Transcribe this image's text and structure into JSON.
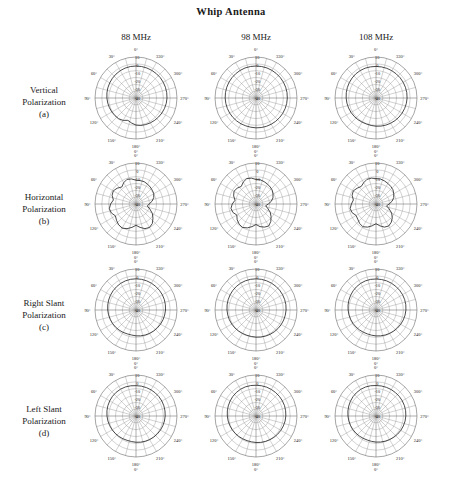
{
  "title": "Whip Antenna",
  "columns": [
    {
      "label": "88 MHz"
    },
    {
      "label": "98 MHz"
    },
    {
      "label": "108 MHz"
    }
  ],
  "rows": [
    {
      "name": "Vertical",
      "line2": "Polarization",
      "tag": "(a)"
    },
    {
      "name": "Horizontal",
      "line2": "Polarization",
      "tag": "(b)"
    },
    {
      "name": "Right Slant",
      "line2": "Polarization",
      "tag": "(c)"
    },
    {
      "name": "Left Slant",
      "line2": "Polarization",
      "tag": "(d)"
    }
  ],
  "chart_data": {
    "type": "line",
    "title": "Whip Antenna",
    "subtype": "polar radiation pattern grid",
    "grid_rows": 4,
    "grid_cols": 3,
    "angular_axis": {
      "unit": "degrees",
      "start_at_top": 0,
      "direction": "counterclockwise-labels",
      "tick_step": 30,
      "tick_labels": [
        "0°",
        "30°",
        "60°",
        "90°",
        "120°",
        "150°",
        "180°",
        "210°",
        "240°",
        "270°",
        "300°",
        "330°"
      ],
      "extra_bottom_label": "0°"
    },
    "radial_axis": {
      "unit": "dB",
      "tick_labels": [
        "10",
        "0",
        "-10",
        "-20",
        "-30",
        "-40"
      ],
      "outer_value": 10,
      "center_value": -40,
      "rings": 6
    },
    "panels": [
      {
        "row": "Vertical Polarization (a)",
        "frequency": "88 MHz",
        "shape": "near-omnidirectional, slight notch near 150-165 deg",
        "values_db": [
          -1,
          -1,
          -1.2,
          -1.5,
          -2,
          -2.5,
          -3,
          -3.5,
          -4,
          -4.5,
          -5,
          -5.5,
          -6,
          -6.5,
          -7,
          -8.5,
          -11,
          -9,
          -7,
          -6,
          -5.5,
          -5,
          -4.5,
          -4,
          -3.5,
          -3,
          -2.5,
          -2.2,
          -2,
          -1.8,
          -1.6,
          -1.4,
          -1.3,
          -1.2,
          -1.1,
          -1
        ]
      },
      {
        "row": "Vertical Polarization (a)",
        "frequency": "98 MHz",
        "shape": "near-omnidirectional, very smooth circle",
        "values_db": [
          -1,
          -1,
          -1,
          -1.2,
          -1.4,
          -1.6,
          -1.8,
          -2,
          -2.2,
          -2.4,
          -2.6,
          -2.8,
          -3,
          -3.2,
          -3.4,
          -3.6,
          -3.8,
          -3.8,
          -3.6,
          -3.4,
          -3.2,
          -3,
          -2.8,
          -2.6,
          -2.4,
          -2.2,
          -2,
          -1.8,
          -1.6,
          -1.5,
          -1.4,
          -1.3,
          -1.2,
          -1.1,
          -1,
          -1
        ]
      },
      {
        "row": "Vertical Polarization (a)",
        "frequency": "108 MHz",
        "shape": "near-omnidirectional, mild ripple",
        "values_db": [
          -1.5,
          -1.4,
          -1.3,
          -1.4,
          -1.6,
          -2,
          -2.4,
          -2.8,
          -3.2,
          -3.6,
          -4,
          -4.4,
          -4.8,
          -5.2,
          -5.6,
          -6,
          -6.2,
          -6,
          -5.6,
          -5.2,
          -4.8,
          -4.4,
          -4,
          -3.6,
          -3.2,
          -2.8,
          -2.4,
          -2.1,
          -1.9,
          -1.8,
          -1.7,
          -1.6,
          -1.6,
          -1.5,
          -1.5,
          -1.5
        ]
      },
      {
        "row": "Horizontal Polarization (b)",
        "frequency": "88 MHz",
        "shape": "strongly lobed, multiple deep nulls, figure-of-eight-like with ripples",
        "values_db": [
          -11,
          -9,
          -8,
          -10,
          -13,
          -10,
          -8,
          -9,
          -12,
          -9,
          -7,
          -8,
          -11,
          -9,
          -7,
          -6,
          -8,
          -11,
          -14,
          -11,
          -8,
          -7,
          -9,
          -13,
          -17,
          -22,
          -26,
          -24,
          -20,
          -17,
          -15,
          -14,
          -13,
          -12,
          -11,
          -11
        ]
      },
      {
        "row": "Horizontal Polarization (b)",
        "frequency": "98 MHz",
        "shape": "strongly lobed with nulls near 270-330 deg",
        "values_db": [
          -10,
          -8,
          -7,
          -9,
          -12,
          -10,
          -9,
          -11,
          -14,
          -11,
          -9,
          -10,
          -13,
          -10,
          -8,
          -7,
          -9,
          -12,
          -15,
          -12,
          -10,
          -9,
          -12,
          -16,
          -20,
          -25,
          -28,
          -25,
          -21,
          -18,
          -16,
          -14,
          -13,
          -12,
          -11,
          -10
        ]
      },
      {
        "row": "Horizontal Polarization (b)",
        "frequency": "108 MHz",
        "shape": "strongly lobed, two broad lobes upper-left and lower-right",
        "values_db": [
          -9,
          -8,
          -8,
          -10,
          -12,
          -10,
          -8,
          -9,
          -12,
          -10,
          -8,
          -9,
          -12,
          -11,
          -9,
          -8,
          -10,
          -13,
          -16,
          -13,
          -10,
          -9,
          -11,
          -14,
          -18,
          -23,
          -27,
          -24,
          -20,
          -17,
          -15,
          -13,
          -12,
          -11,
          -10,
          -9
        ]
      },
      {
        "row": "Right Slant Polarization (c)",
        "frequency": "88 MHz",
        "shape": "smooth near-circular, slight flattening near 90-120 deg",
        "values_db": [
          -2,
          -2,
          -2.2,
          -2.5,
          -3,
          -3.5,
          -4,
          -4.5,
          -5,
          -5.5,
          -6,
          -6.5,
          -7,
          -7.5,
          -8,
          -8.5,
          -9,
          -9,
          -8.5,
          -8,
          -7.5,
          -7,
          -6.5,
          -6,
          -5.5,
          -5,
          -4.5,
          -4,
          -3.6,
          -3.2,
          -2.9,
          -2.7,
          -2.5,
          -2.3,
          -2.1,
          -2
        ]
      },
      {
        "row": "Right Slant Polarization (c)",
        "frequency": "98 MHz",
        "shape": "smooth near-circular",
        "values_db": [
          -2,
          -2,
          -2.1,
          -2.3,
          -2.6,
          -3,
          -3.4,
          -3.8,
          -4.2,
          -4.6,
          -5,
          -5.4,
          -5.8,
          -6.2,
          -6.6,
          -7,
          -7.2,
          -7.2,
          -6.9,
          -6.5,
          -6.1,
          -5.7,
          -5.3,
          -4.9,
          -4.5,
          -4.1,
          -3.7,
          -3.3,
          -3,
          -2.8,
          -2.6,
          -2.4,
          -2.3,
          -2.2,
          -2.1,
          -2
        ]
      },
      {
        "row": "Right Slant Polarization (c)",
        "frequency": "108 MHz",
        "shape": "smooth near-circular with small ripple",
        "values_db": [
          -2.2,
          -2.1,
          -2.2,
          -2.5,
          -3,
          -3.6,
          -4.2,
          -4.8,
          -5.4,
          -6,
          -6.5,
          -7,
          -7.5,
          -8,
          -8.4,
          -8.8,
          -9,
          -8.8,
          -8.4,
          -8,
          -7.5,
          -7,
          -6.4,
          -5.8,
          -5.2,
          -4.6,
          -4,
          -3.5,
          -3.1,
          -2.8,
          -2.6,
          -2.5,
          -2.4,
          -2.3,
          -2.2,
          -2.2
        ]
      },
      {
        "row": "Left Slant Polarization (d)",
        "frequency": "88 MHz",
        "shape": "smooth near-circular, slight bulge near 60-90 deg",
        "values_db": [
          -3,
          -2.6,
          -2.3,
          -2.2,
          -2.3,
          -2.6,
          -3,
          -3.5,
          -4,
          -4.6,
          -5.2,
          -5.8,
          -6.4,
          -7,
          -7.5,
          -8,
          -8.4,
          -8.4,
          -8,
          -7.6,
          -7.2,
          -6.8,
          -6.4,
          -6,
          -5.6,
          -5.2,
          -4.8,
          -4.4,
          -4.1,
          -3.8,
          -3.6,
          -3.4,
          -3.3,
          -3.2,
          -3.1,
          -3
        ]
      },
      {
        "row": "Left Slant Polarization (d)",
        "frequency": "98 MHz",
        "shape": "smooth near-circular",
        "values_db": [
          -2.5,
          -2.3,
          -2.2,
          -2.3,
          -2.6,
          -3,
          -3.5,
          -4,
          -4.5,
          -5,
          -5.5,
          -6,
          -6.5,
          -7,
          -7.4,
          -7.8,
          -8,
          -8,
          -7.7,
          -7.3,
          -6.9,
          -6.5,
          -6,
          -5.5,
          -5,
          -4.5,
          -4,
          -3.6,
          -3.3,
          -3,
          -2.9,
          -2.8,
          -2.7,
          -2.6,
          -2.5,
          -2.5
        ]
      },
      {
        "row": "Left Slant Polarization (d)",
        "frequency": "108 MHz",
        "shape": "smooth near-circular with mild ripples",
        "values_db": [
          -2.8,
          -2.5,
          -2.4,
          -2.5,
          -2.9,
          -3.4,
          -4,
          -4.6,
          -5.2,
          -5.8,
          -6.3,
          -6.8,
          -7.3,
          -7.8,
          -8.2,
          -8.6,
          -8.8,
          -8.6,
          -8.2,
          -7.8,
          -7.3,
          -6.8,
          -6.2,
          -5.6,
          -5,
          -4.5,
          -4,
          -3.6,
          -3.3,
          -3.1,
          -3,
          -2.9,
          -2.9,
          -2.8,
          -2.8,
          -2.8
        ]
      }
    ]
  }
}
